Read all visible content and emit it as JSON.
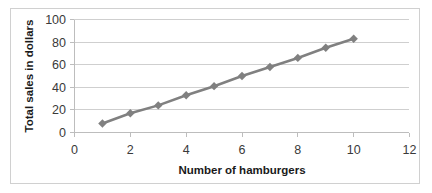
{
  "chart_data": {
    "type": "line",
    "title": "",
    "xlabel": "Number of hamburgers",
    "ylabel": "Total sales in dollars",
    "x": [
      1,
      2,
      3,
      4,
      5,
      6,
      7,
      8,
      9,
      10
    ],
    "values": [
      8,
      17,
      24,
      33,
      41,
      50,
      58,
      66,
      75,
      83
    ],
    "series": [
      {
        "name": "Total sales",
        "x": [
          1,
          2,
          3,
          4,
          5,
          6,
          7,
          8,
          9,
          10
        ],
        "values": [
          8,
          17,
          24,
          33,
          41,
          50,
          58,
          66,
          75,
          83
        ]
      }
    ],
    "xlim": [
      0,
      12
    ],
    "ylim": [
      0,
      100
    ],
    "xticks": [
      0,
      2,
      4,
      6,
      8,
      10,
      12
    ],
    "yticks": [
      0,
      20,
      40,
      60,
      80,
      100
    ],
    "xtick_labels": [
      "0",
      "2",
      "4",
      "6",
      "8",
      "10",
      "12"
    ],
    "ytick_labels": [
      "0",
      "20",
      "40",
      "60",
      "80",
      "100"
    ],
    "grid": "horizontal",
    "legend": "none",
    "marker": "diamond",
    "colors": {
      "series": "#808080",
      "gridline": "#cfcfcf",
      "axis": "#bdbdbd",
      "text": "#1a1a1a",
      "background": "#ffffff",
      "border": "#d0d0d0"
    }
  }
}
